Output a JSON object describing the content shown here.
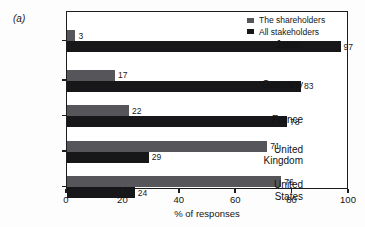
{
  "figure": {
    "panel_letter": "(a)",
    "background_color": "#fdfdfd",
    "frame_color": "#1d1d1d"
  },
  "legend": {
    "position": "top-right-inside",
    "items": [
      {
        "label": "The shareholders",
        "color": "#56565a",
        "swatch": "legend-swatch-light"
      },
      {
        "label": "All stakeholders",
        "color": "#17171a",
        "swatch": "legend-swatch-dark"
      }
    ]
  },
  "axis": {
    "x_title": "% of responses",
    "x_ticks": [
      "0",
      "20",
      "40",
      "60",
      "80",
      "100"
    ],
    "x_min": 0,
    "x_max": 100
  },
  "chart_data": {
    "type": "bar",
    "orientation": "horizontal",
    "title": "",
    "subtitle": "",
    "xlabel": "% of responses",
    "ylabel": "",
    "xlim": [
      0,
      100
    ],
    "grid": false,
    "legend_position": "upper right (inside axes)",
    "categories": [
      "Japan",
      "Germany",
      "France",
      "United Kingdom",
      "United States"
    ],
    "category_label_lines": [
      [
        "Japan"
      ],
      [
        "Germany"
      ],
      [
        "France"
      ],
      [
        "United",
        "Kingdom"
      ],
      [
        "United",
        "States"
      ]
    ],
    "series": [
      {
        "name": "The shareholders",
        "color": "#56565a",
        "values": [
          3,
          17,
          22,
          71,
          76
        ]
      },
      {
        "name": "All stakeholders",
        "color": "#17171a",
        "values": [
          97,
          83,
          78,
          29,
          24
        ]
      }
    ],
    "data_labels": {
      "The shareholders": [
        "3",
        "17",
        "22",
        "71",
        "76"
      ],
      "All stakeholders": [
        "97",
        "83",
        "78",
        "29",
        "24"
      ]
    },
    "annotations": [
      "(a)"
    ]
  }
}
